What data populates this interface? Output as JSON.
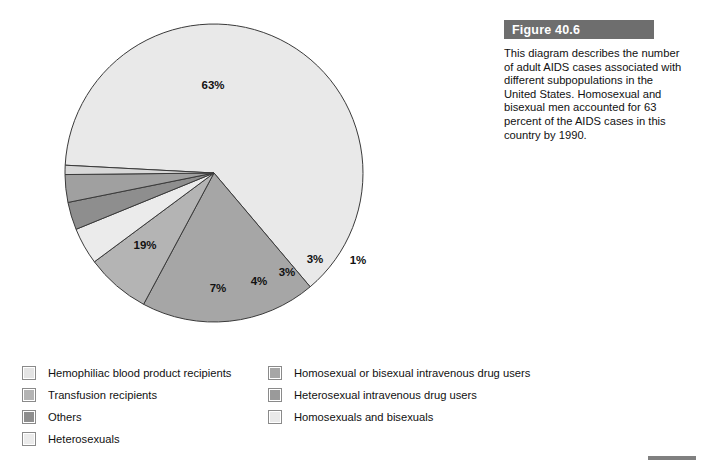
{
  "figure": {
    "banner_label": "Figure 40.6",
    "caption": "This diagram describes the number of adult AIDS cases associated with different subpopulations in the United States. Homosexual and bisexual men accounted for 63 percent of the AIDS cases in this country by 1990."
  },
  "chart_data": {
    "type": "pie",
    "title": "Figure 40.6",
    "xlabel": "",
    "ylabel": "",
    "unit": "percent",
    "legend_position": "bottom",
    "grid": false,
    "start_angle_deg": 183,
    "direction": "clockwise",
    "categories": [
      "Homosexuals and bisexuals",
      "Homosexual or bisexual intravenous drug users",
      "Heterosexual intravenous drug users",
      "Heterosexuals",
      "Others",
      "Transfusion recipients",
      "Hemophiliac blood product recipients"
    ],
    "values": [
      63,
      19,
      7,
      4,
      3,
      3,
      1
    ],
    "labels": [
      "63%",
      "19%",
      "7%",
      "4%",
      "3%",
      "3%",
      "1%"
    ],
    "colors": [
      "#e9e9e9",
      "#a6a6a6",
      "#b4b4b4",
      "#ebebeb",
      "#8e8e8e",
      "#a0a0a0",
      "#d8d8d8"
    ],
    "slice_label_positions": [
      {
        "label": "63%",
        "x": 213,
        "y": 89
      },
      {
        "label": "19%",
        "x": 145,
        "y": 249
      },
      {
        "label": "7%",
        "x": 218,
        "y": 292
      },
      {
        "label": "4%",
        "x": 259,
        "y": 285
      },
      {
        "label": "3%",
        "x": 287,
        "y": 276
      },
      {
        "label": "3%",
        "x": 315,
        "y": 263
      },
      {
        "label": "1%",
        "x": 358,
        "y": 264
      }
    ]
  },
  "legend": {
    "columns": [
      {
        "items": [
          {
            "label": "Hemophiliac blood product recipients",
            "color": "#e4e4e4",
            "swatch": "legend-swatch-hemophiliac"
          },
          {
            "label": "Transfusion recipients",
            "color": "#b4b4b4",
            "swatch": "legend-swatch-transfusion"
          },
          {
            "label": "Others",
            "color": "#8e8e8e",
            "swatch": "legend-swatch-others"
          },
          {
            "label": "Heterosexuals",
            "color": "#ebebeb",
            "swatch": "legend-swatch-heterosexuals"
          }
        ]
      },
      {
        "items": [
          {
            "label": "Homosexual or bisexual intravenous drug users",
            "color": "#a6a6a6",
            "swatch": "legend-swatch-homo-bi-iv"
          },
          {
            "label": "Heterosexual intravenous drug users",
            "color": "#9a9a9a",
            "swatch": "legend-swatch-hetero-iv"
          },
          {
            "label": "Homosexuals and bisexuals",
            "color": "#e9e9e9",
            "swatch": "legend-swatch-homo-bi"
          }
        ]
      }
    ]
  },
  "colors": {
    "banner_bg": "#6e6e6e",
    "banner_text": "#ffffff",
    "stroke": "#3a3a3a",
    "page_bg": "#ffffff",
    "rule": "#808080"
  }
}
